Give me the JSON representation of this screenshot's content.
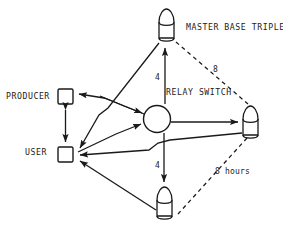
{
  "diagram": {
    "title_text": "MASTER BASE TRIPLET",
    "nodes": {
      "relay_switch": {
        "label": "RELAY SWITCH",
        "shape": "circle"
      },
      "producer": {
        "label": "PRODUCER",
        "shape": "square"
      },
      "user": {
        "label": "USER",
        "shape": "square"
      },
      "base_top": {
        "label": "",
        "shape": "bullet-capsule"
      },
      "base_right": {
        "label": "",
        "shape": "bullet-capsule"
      },
      "base_bottom": {
        "label": "",
        "shape": "bullet-capsule"
      }
    },
    "edge_labels": {
      "relay_to_top": "4",
      "relay_to_bottom": "4",
      "top_to_right_dashed": "8",
      "right_to_bottom_dashed": "8 hours"
    },
    "colors": {
      "stroke": "#1a1a1a",
      "background": "#ffffff",
      "text": "#1a1a1a"
    }
  }
}
